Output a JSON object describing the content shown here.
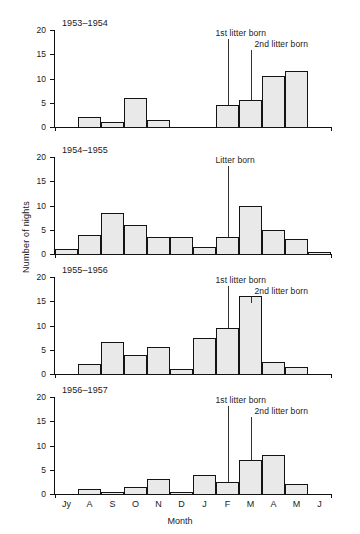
{
  "chart_data": {
    "type": "bar",
    "title": "",
    "xlabel": "Month",
    "ylabel": "Number of nights",
    "ylim": [
      0,
      20
    ],
    "yticks": [
      0,
      5,
      10,
      15,
      20
    ],
    "grid": false,
    "legend": "none",
    "categories": [
      "Jy",
      "A",
      "S",
      "O",
      "N",
      "D",
      "J",
      "F",
      "M",
      "A",
      "M",
      "J"
    ],
    "panels": [
      {
        "title": "1953–1954",
        "values": [
          0,
          2,
          1,
          6,
          1.5,
          0,
          0,
          4.5,
          5.5,
          10.5,
          11.5,
          0
        ],
        "annotations": [
          {
            "label": "1st litter born",
            "month": "F"
          },
          {
            "label": "2nd litter born",
            "month": "M"
          }
        ]
      },
      {
        "title": "1954–1955",
        "values": [
          1,
          4,
          8.5,
          6,
          3.5,
          3.5,
          1.5,
          3.5,
          10,
          5,
          3,
          0.5
        ],
        "annotations": [
          {
            "label": "Litter born",
            "month": "F"
          }
        ]
      },
      {
        "title": "1955–1956",
        "values": [
          0,
          2,
          6.5,
          4,
          5.5,
          1,
          7.5,
          9.5,
          16,
          2.5,
          1.5,
          0
        ],
        "annotations": [
          {
            "label": "1st litter born",
            "month": "F"
          },
          {
            "label": "2nd litter born",
            "month": "M"
          }
        ]
      },
      {
        "title": "1956–1957",
        "values": [
          0,
          1,
          0.5,
          1.5,
          3,
          0.5,
          4,
          2.5,
          7,
          8,
          2,
          0
        ],
        "annotations": [
          {
            "label": "1st litter born",
            "month": "F"
          },
          {
            "label": "2nd litter born",
            "month": "M"
          }
        ]
      }
    ],
    "colors": {
      "bar_fill": "#e9e9e9",
      "bar_stroke": "#141414",
      "axis": "#111111",
      "text": "#1a1a1a"
    }
  }
}
